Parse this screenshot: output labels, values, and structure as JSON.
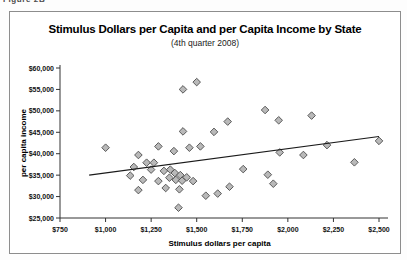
{
  "figure_label": "Figure 2B",
  "chart_data": {
    "type": "scatter",
    "title": "Stimulus Dollars per Capita and per Capita Income by State",
    "subtitle": "(4th quarter 2008)",
    "xlabel": "Stimulus dollars per capita",
    "ylabel": "per capita income",
    "xlim": [
      750,
      2500
    ],
    "ylim": [
      25000,
      60000
    ],
    "grid": false,
    "legend": false,
    "x_ticks": [
      750,
      1000,
      1250,
      1500,
      1750,
      2000,
      2250,
      2500
    ],
    "x_tick_labels": [
      "$750",
      "$1,000",
      "$1,250",
      "$1,500",
      "$1,750",
      "$2,000",
      "$2,250",
      "$2,500"
    ],
    "y_ticks": [
      25000,
      30000,
      35000,
      40000,
      45000,
      50000,
      55000,
      60000
    ],
    "y_tick_labels": [
      "$25,000",
      "$30,000",
      "$35,000",
      "$40,000",
      "$45,000",
      "$50,000",
      "$55,000",
      "$60,000"
    ],
    "marker": {
      "shape": "diamond",
      "fill": "#b9b9b9",
      "stroke": "#4d4d4d"
    },
    "axis_color": "#333333",
    "trend_line": {
      "x1": 910,
      "y1": 35000,
      "x2": 2500,
      "y2": 44000,
      "color": "#1a1a1a"
    },
    "points": [
      [
        1000,
        41400
      ],
      [
        1135,
        34900
      ],
      [
        1155,
        36900
      ],
      [
        1180,
        39700
      ],
      [
        1180,
        31500
      ],
      [
        1205,
        33900
      ],
      [
        1225,
        37900
      ],
      [
        1250,
        36300
      ],
      [
        1265,
        37900
      ],
      [
        1290,
        41700
      ],
      [
        1290,
        33600
      ],
      [
        1320,
        36000
      ],
      [
        1330,
        32000
      ],
      [
        1350,
        34400
      ],
      [
        1355,
        36300
      ],
      [
        1375,
        40600
      ],
      [
        1380,
        35500
      ],
      [
        1385,
        33900
      ],
      [
        1400,
        27400
      ],
      [
        1405,
        31700
      ],
      [
        1410,
        35000
      ],
      [
        1420,
        33700
      ],
      [
        1425,
        45200
      ],
      [
        1425,
        55000
      ],
      [
        1445,
        34500
      ],
      [
        1460,
        41400
      ],
      [
        1480,
        33600
      ],
      [
        1500,
        56700
      ],
      [
        1520,
        41700
      ],
      [
        1550,
        30200
      ],
      [
        1595,
        45100
      ],
      [
        1615,
        30700
      ],
      [
        1670,
        47500
      ],
      [
        1680,
        32300
      ],
      [
        1755,
        36400
      ],
      [
        1875,
        50200
      ],
      [
        1890,
        35100
      ],
      [
        1920,
        33000
      ],
      [
        1950,
        47800
      ],
      [
        1955,
        40300
      ],
      [
        2085,
        39700
      ],
      [
        2130,
        48900
      ],
      [
        2215,
        42000
      ],
      [
        2365,
        38000
      ],
      [
        2500,
        43000
      ]
    ]
  }
}
